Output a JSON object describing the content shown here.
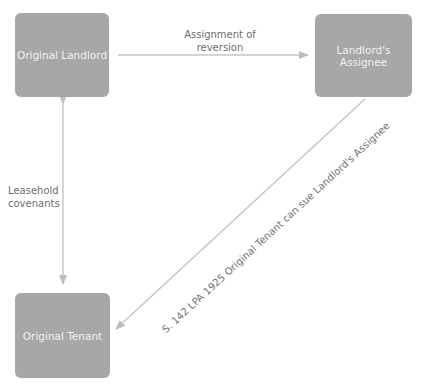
{
  "nodes": {
    "original_landlord": "Original Landlord",
    "landlords_assignee": "Landlord's Assignee",
    "original_tenant": "Original Tenant"
  },
  "edges": {
    "assignment": {
      "line1": "Assignment of",
      "line2": "reversion"
    },
    "covenants": {
      "line1": "Leasehold",
      "line2": "covenants"
    },
    "s142": "S. 142 LPA 1925 Original Tenant can sue Landlord's Assignee"
  },
  "colors": {
    "node_fill": "#a7a7a7",
    "edge": "#c4c4c4",
    "node_text": "#f2f2f2",
    "label_text": "#6d6d6d"
  }
}
